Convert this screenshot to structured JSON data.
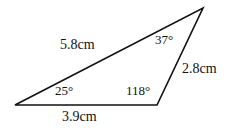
{
  "figure": {
    "type": "triangle-diagram",
    "background_color": "#ffffff",
    "stroke_color": "#111111",
    "text_color": "#111111",
    "vertices": {
      "left": [
        15,
        105
      ],
      "bottom_right": [
        157,
        105
      ],
      "apex": [
        203,
        8
      ]
    },
    "labels": {
      "side_upper_left": "5.8cm",
      "side_right": "2.8cm",
      "side_bottom": "3.9cm",
      "angle_left": "25°",
      "angle_apex": "37°",
      "angle_bottom_right": "118°"
    }
  },
  "chart_data": {
    "type": "diagram",
    "title": "",
    "shape": "triangle",
    "vertices": [
      {
        "id": "A",
        "name": "left-vertex",
        "x": 15,
        "y": 105,
        "angle_deg": 25,
        "angle_label": "25°"
      },
      {
        "id": "B",
        "name": "apex-vertex",
        "x": 203,
        "y": 8,
        "angle_deg": 37,
        "angle_label": "37°"
      },
      {
        "id": "C",
        "name": "bottom-right-vertex",
        "x": 157,
        "y": 105,
        "angle_deg": 118,
        "angle_label": "118°"
      }
    ],
    "sides": [
      {
        "from": "A",
        "to": "B",
        "name": "upper-left-side",
        "length": 5.8,
        "unit": "cm",
        "label": "5.8cm"
      },
      {
        "from": "B",
        "to": "C",
        "name": "right-side",
        "length": 2.8,
        "unit": "cm",
        "label": "2.8cm"
      },
      {
        "from": "C",
        "to": "A",
        "name": "bottom-side",
        "length": 3.9,
        "unit": "cm",
        "label": "3.9cm"
      }
    ],
    "angle_sum_deg": 180,
    "grid": false,
    "legend": false
  }
}
